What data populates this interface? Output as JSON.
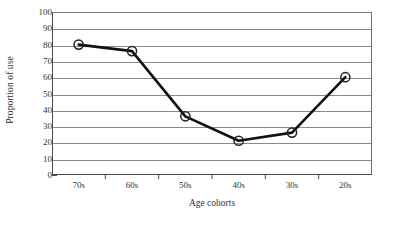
{
  "chart_data": {
    "type": "line",
    "title": "",
    "xlabel": "Age cohorts",
    "ylabel": "Proportion of use",
    "categories": [
      "70s",
      "60s",
      "50s",
      "40s",
      "30s",
      "20s"
    ],
    "values": [
      80,
      76,
      36,
      21,
      26,
      60
    ],
    "series": [
      {
        "name": "Proportion of use",
        "values": [
          80,
          76,
          36,
          21,
          26,
          60
        ]
      }
    ],
    "ylim": [
      0,
      100
    ],
    "ytick_labels": [
      "0",
      "10",
      "20",
      "30",
      "40",
      "50",
      "60",
      "70",
      "80",
      "90",
      "100"
    ],
    "ytick_values": [
      0,
      10,
      20,
      30,
      40,
      50,
      60,
      70,
      80,
      90,
      100
    ],
    "grid": true,
    "grid_axis": "y",
    "legend": false,
    "legend_position": "none",
    "marker": "open-circle",
    "line_color": "#111111",
    "marker_fill": "#ffffff",
    "marker_edge_color": "#222222",
    "grid_color": "#8a8a8a",
    "axis_color": "#4a4a4a",
    "background_color": "#ffffff"
  }
}
